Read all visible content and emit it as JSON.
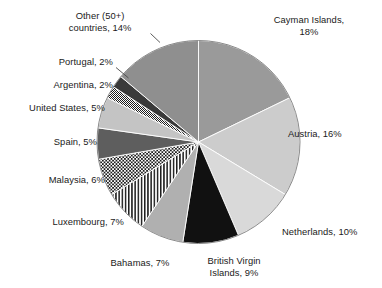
{
  "chart_data": {
    "type": "pie",
    "title": "",
    "subtitle": "",
    "xlabel": "",
    "ylabel": "",
    "legend_position": "none",
    "grid": false,
    "start_angle_deg": 0,
    "direction": "clockwise",
    "unit": "%",
    "categories": [
      "Cayman Islands",
      "Austria",
      "Netherlands",
      "British Virgin Islands",
      "Bahamas",
      "Luxembourg",
      "Malaysia",
      "Spain",
      "United States",
      "Argentina",
      "Portugal",
      "Other (50+) countries"
    ],
    "values": [
      18,
      16,
      10,
      9,
      7,
      7,
      6,
      5,
      5,
      2,
      2,
      14
    ],
    "slices": [
      {
        "label": "Cayman Islands",
        "value": 18,
        "display": "Cayman Islands,\n18%",
        "fill": "#9a9a9a",
        "pattern": "solid"
      },
      {
        "label": "Austria",
        "value": 16,
        "display": "Austria, 16%",
        "fill": "#cccccc",
        "pattern": "solid"
      },
      {
        "label": "Netherlands",
        "value": 10,
        "display": "Netherlands, 10%",
        "fill": "#d9d9d9",
        "pattern": "solid"
      },
      {
        "label": "British Virgin Islands",
        "value": 9,
        "display": "British Virgin\nIslands, 9%",
        "fill": "#111111",
        "pattern": "solid"
      },
      {
        "label": "Bahamas",
        "value": 7,
        "display": "Bahamas, 7%",
        "fill": "#b0b0b0",
        "pattern": "solid"
      },
      {
        "label": "Luxembourg",
        "value": 7,
        "display": "Luxembourg, 7%",
        "fill": "#ffffff",
        "pattern": "vertical-stripes"
      },
      {
        "label": "Malaysia",
        "value": 6,
        "display": "Malaysia, 6%",
        "fill": "#ffffff",
        "pattern": "checker"
      },
      {
        "label": "Spain",
        "value": 5,
        "display": "Spain, 5%",
        "fill": "#5e5e5e",
        "pattern": "solid"
      },
      {
        "label": "United States",
        "value": 5,
        "display": "United States, 5%",
        "fill": "#c4c4c4",
        "pattern": "solid"
      },
      {
        "label": "Argentina",
        "value": 2,
        "display": "Argentina, 2%",
        "fill": "#ffffff",
        "pattern": "fine-checker"
      },
      {
        "label": "Portugal",
        "value": 2,
        "display": "Portugal, 2%",
        "fill": "#3a3a3a",
        "pattern": "solid"
      },
      {
        "label": "Other (50+) countries",
        "value": 14,
        "display": "Other (50+)\ncountries, 14%",
        "fill": "#8f8f8f",
        "pattern": "solid"
      }
    ]
  },
  "labels": {
    "cayman_islands": "Cayman Islands,\n18%",
    "austria": "Austria, 16%",
    "netherlands": "Netherlands, 10%",
    "british_virgin_islands": "British Virgin\nIslands, 9%",
    "bahamas": "Bahamas, 7%",
    "luxembourg": "Luxembourg, 7%",
    "malaysia": "Malaysia, 6%",
    "spain": "Spain, 5%",
    "united_states": "United States, 5%",
    "argentina": "Argentina, 2%",
    "portugal": "Portugal, 2%",
    "other_countries": "Other (50+)\ncountries, 14%"
  }
}
